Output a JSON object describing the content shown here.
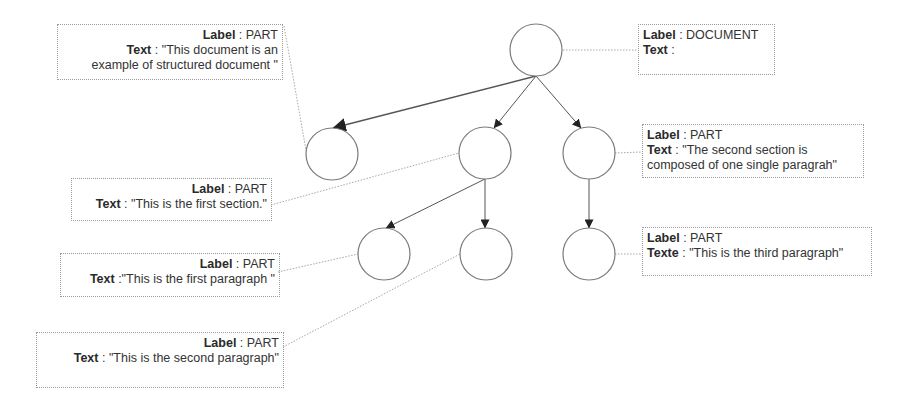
{
  "diagram": {
    "colors": {
      "node_stroke": "#7a7a7a",
      "edge": "#555555",
      "arrowhead": "#222222",
      "leader": "#a8a8a8",
      "box_border": "#9a9a9a",
      "text": "#2a2a2a"
    },
    "nodes": [
      {
        "id": "root",
        "cx": 536,
        "cy": 50,
        "r": 26
      },
      {
        "id": "part-intro",
        "cx": 332,
        "cy": 154,
        "r": 26
      },
      {
        "id": "section-1",
        "cx": 485,
        "cy": 153,
        "r": 26
      },
      {
        "id": "section-2",
        "cx": 589,
        "cy": 153,
        "r": 26
      },
      {
        "id": "paragraph-1",
        "cx": 384,
        "cy": 254,
        "r": 26
      },
      {
        "id": "paragraph-2",
        "cx": 486,
        "cy": 254,
        "r": 26
      },
      {
        "id": "paragraph-3",
        "cx": 589,
        "cy": 254,
        "r": 26
      }
    ],
    "edges": [
      {
        "from": "root",
        "to": "part-intro",
        "x1": 536,
        "y1": 76,
        "x2": 333,
        "y2": 128
      },
      {
        "from": "root",
        "to": "section-1",
        "x1": 536,
        "y1": 76,
        "x2": 494,
        "y2": 128
      },
      {
        "from": "root",
        "to": "section-2",
        "x1": 536,
        "y1": 76,
        "x2": 581,
        "y2": 128
      },
      {
        "from": "section-1",
        "to": "paragraph-1",
        "x1": 485,
        "y1": 179,
        "x2": 386,
        "y2": 228
      },
      {
        "from": "section-1",
        "to": "paragraph-2",
        "x1": 485,
        "y1": 179,
        "x2": 485,
        "y2": 228
      },
      {
        "from": "section-2",
        "to": "paragraph-3",
        "x1": 589,
        "y1": 179,
        "x2": 589,
        "y2": 228
      }
    ],
    "leaders": [
      {
        "to": "root",
        "x1": 563,
        "y1": 50,
        "x2": 638,
        "y2": 50
      },
      {
        "to": "part-intro",
        "x1": 284,
        "y1": 26,
        "x2": 306,
        "y2": 150
      },
      {
        "to": "section-1",
        "x1": 271,
        "y1": 205,
        "x2": 459,
        "y2": 153
      },
      {
        "to": "section-2",
        "x1": 615,
        "y1": 153,
        "x2": 642,
        "y2": 152
      },
      {
        "to": "paragraph-1",
        "x1": 278,
        "y1": 272,
        "x2": 358,
        "y2": 254
      },
      {
        "to": "paragraph-2",
        "x1": 283,
        "y1": 347,
        "x2": 460,
        "y2": 254
      },
      {
        "to": "paragraph-3",
        "x1": 615,
        "y1": 254,
        "x2": 642,
        "y2": 254
      }
    ],
    "labels": [
      {
        "node": "root",
        "align": "left",
        "x": 638,
        "y": 24,
        "w": 137,
        "h": 51,
        "rows": [
          {
            "key": "Label",
            "sep": " : ",
            "value": "DOCUMENT"
          },
          {
            "key": "Text",
            "sep": " :",
            "value": ""
          }
        ]
      },
      {
        "node": "part-intro",
        "align": "right",
        "x": 57,
        "y": 24,
        "w": 226,
        "h": 56,
        "rows": [
          {
            "key": "Label",
            "sep": " : ",
            "value": "PART"
          },
          {
            "key": "Text",
            "sep": " : ",
            "value": "\"This document is an"
          },
          {
            "key": "",
            "sep": "",
            "value": "example of structured document \""
          }
        ]
      },
      {
        "node": "section-2",
        "align": "left",
        "x": 642,
        "y": 124,
        "w": 222,
        "h": 54,
        "rows": [
          {
            "key": "Label",
            "sep": " : ",
            "value": "PART"
          },
          {
            "key": "Text",
            "sep": " : ",
            "value": "\"The second section is"
          },
          {
            "key": "",
            "sep": "",
            "value": "composed of one single paragrah\""
          }
        ]
      },
      {
        "node": "section-1",
        "align": "right",
        "x": 71,
        "y": 178,
        "w": 201,
        "h": 43,
        "rows": [
          {
            "key": "Label",
            "sep": " : ",
            "value": "PART"
          },
          {
            "key": "Text",
            "sep": " : ",
            "value": "\"This is the first section.\""
          }
        ]
      },
      {
        "node": "paragraph-3",
        "align": "left",
        "x": 642,
        "y": 227,
        "w": 230,
        "h": 49,
        "rows": [
          {
            "key": "Label",
            "sep": " : ",
            "value": "PART"
          },
          {
            "key": "Texte",
            "sep": " : ",
            "value": "\"This is the third paragraph\""
          }
        ]
      },
      {
        "node": "paragraph-1",
        "align": "right",
        "x": 60,
        "y": 253,
        "w": 220,
        "h": 44,
        "rows": [
          {
            "key": "Label",
            "sep": " : ",
            "value": "PART"
          },
          {
            "key": "Text",
            "sep": " :",
            "value": "\"This is the first paragraph \""
          }
        ]
      },
      {
        "node": "paragraph-2",
        "align": "right",
        "x": 36,
        "y": 332,
        "w": 248,
        "h": 56,
        "rows": [
          {
            "key": "Label",
            "sep": " : ",
            "value": "PART"
          },
          {
            "key": "Text",
            "sep": " : ",
            "value": "\"This is the second paragraph\""
          }
        ]
      }
    ]
  }
}
